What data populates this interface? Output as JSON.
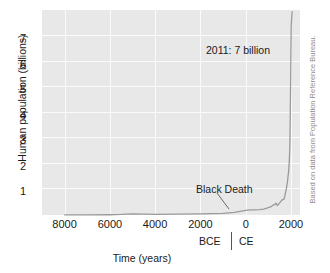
{
  "chart_data": {
    "type": "line",
    "title": "",
    "xlabel": "Time (years)",
    "ylabel": "Human population (billions)",
    "xlim": [
      -9000,
      2400
    ],
    "ylim": [
      0,
      7.6
    ],
    "grid": true,
    "legend": null,
    "x_tick_labels": [
      "8000",
      "6000",
      "4000",
      "2000",
      "0",
      "2000"
    ],
    "x_tick_values": [
      -8000,
      -6000,
      -4000,
      -2000,
      0,
      2000
    ],
    "y_tick_labels": [
      "1",
      "2",
      "3",
      "4",
      "5",
      "6",
      "7"
    ],
    "y_tick_values": [
      1,
      2,
      3,
      4,
      5,
      6,
      7
    ],
    "era_left_label": "BCE",
    "era_right_label": "CE",
    "series": [
      {
        "name": "Human population",
        "x": [
          -8000,
          -7000,
          -6000,
          -5500,
          -5000,
          -4500,
          -4000,
          -3000,
          -2000,
          -1500,
          -1000,
          -500,
          0,
          200,
          400,
          600,
          800,
          1000,
          1100,
          1200,
          1300,
          1340,
          1400,
          1500,
          1600,
          1700,
          1750,
          1800,
          1850,
          1900,
          1927,
          1950,
          1960,
          1974,
          1987,
          1999,
          2011,
          2050
        ],
        "y": [
          0.005,
          0.008,
          0.01,
          0.02,
          0.04,
          0.03,
          0.025,
          0.03,
          0.045,
          0.05,
          0.06,
          0.1,
          0.17,
          0.19,
          0.19,
          0.2,
          0.22,
          0.27,
          0.3,
          0.36,
          0.4,
          0.44,
          0.35,
          0.45,
          0.55,
          0.6,
          0.79,
          0.98,
          1.26,
          1.65,
          2.0,
          2.5,
          3.0,
          4.0,
          5.0,
          6.0,
          7.0,
          7.55
        ]
      }
    ],
    "annotations": [
      {
        "id": "peak-2011",
        "text": "2011: 7 billion"
      },
      {
        "id": "black-death",
        "text": "Black Death"
      }
    ],
    "credit": "Based on data from Population Reference Bureau.",
    "colors": {
      "plot_background": "#e8e8e8",
      "gridline": "#fbfbfb",
      "line": "#9a9a9a",
      "text": "#1a1a1a",
      "credit_text": "#8d8d8d"
    }
  }
}
